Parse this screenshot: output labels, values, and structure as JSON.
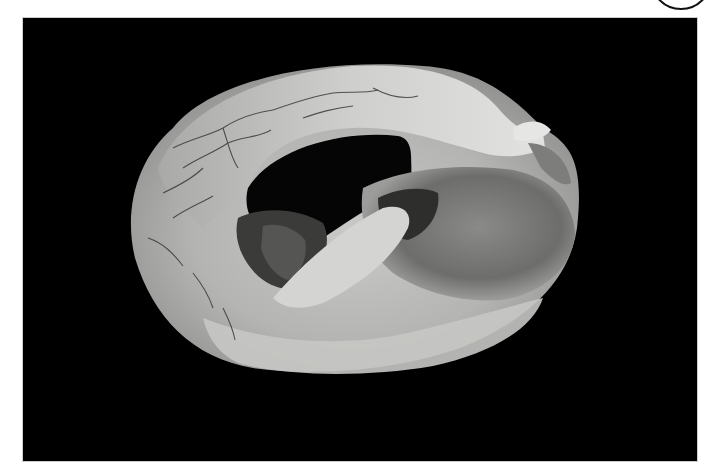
{
  "figure": {
    "subject": "Grayscale photograph of a curled ring-shaped tissue specimen on black background",
    "background_color": "#000000",
    "page_color": "#ffffff",
    "tissue_light": "#d8d8d6",
    "tissue_mid": "#9a9a98",
    "tissue_dark": "#3a3a3a",
    "corner_marker": "circle-outline"
  }
}
